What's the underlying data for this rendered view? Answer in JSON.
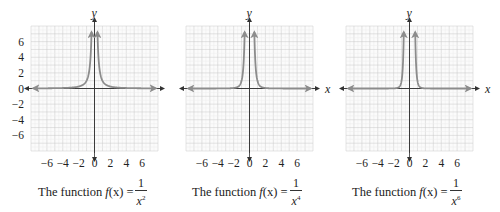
{
  "chart_data": [
    {
      "type": "line",
      "title": "The function f(x) = 1/x^2",
      "function": "1/x^2",
      "exponent": 2,
      "xlabel": "x",
      "ylabel": "y",
      "xlim": [
        -8,
        8
      ],
      "ylim": [
        -8,
        8
      ],
      "x_ticks": [
        "−6",
        "−4",
        "−2",
        "0",
        "2",
        "4",
        "6"
      ],
      "x_tick_values": [
        -6,
        -4,
        -2,
        0,
        2,
        4,
        6
      ],
      "y_ticks": [
        "6",
        "4",
        "2",
        "0",
        "−2",
        "−4",
        "−6"
      ],
      "y_tick_values": [
        6,
        4,
        2,
        0,
        -2,
        -4,
        -6
      ],
      "grid": true,
      "series": [
        {
          "name": "f(x) = 1/x^2 (x<0)",
          "x": [
            -8,
            -4,
            -2,
            -1,
            -0.5,
            -0.4
          ],
          "y": [
            0.016,
            0.0625,
            0.25,
            1,
            4,
            6.25
          ]
        },
        {
          "name": "f(x) = 1/x^2 (x>0)",
          "x": [
            0.4,
            0.5,
            1,
            2,
            4,
            8
          ],
          "y": [
            6.25,
            4,
            1,
            0.25,
            0.0625,
            0.016
          ]
        }
      ]
    },
    {
      "type": "line",
      "title": "The function f(x) = 1/x^4",
      "function": "1/x^4",
      "exponent": 4,
      "xlabel": "x",
      "ylabel": "y",
      "xlim": [
        -8,
        8
      ],
      "ylim": [
        -8,
        8
      ],
      "x_ticks": [
        "−6",
        "−4",
        "−2",
        "0",
        "2",
        "4",
        "6"
      ],
      "x_tick_values": [
        -6,
        -4,
        -2,
        0,
        2,
        4,
        6
      ],
      "y_ticks": [],
      "y_tick_values": [],
      "grid": true,
      "series": [
        {
          "name": "f(x) = 1/x^4 (x<0)",
          "x": [
            -8,
            -4,
            -2,
            -1,
            -0.7,
            -0.62
          ],
          "y": [
            0.0002,
            0.0039,
            0.0625,
            1,
            4.16,
            6.76
          ]
        },
        {
          "name": "f(x) = 1/x^4 (x>0)",
          "x": [
            0.62,
            0.7,
            1,
            2,
            4,
            8
          ],
          "y": [
            6.76,
            4.16,
            1,
            0.0625,
            0.0039,
            0.0002
          ]
        }
      ]
    },
    {
      "type": "line",
      "title": "The function f(x) = 1/x^6",
      "function": "1/x^6",
      "exponent": 6,
      "xlabel": "x",
      "ylabel": "y",
      "xlim": [
        -8,
        8
      ],
      "ylim": [
        -8,
        8
      ],
      "x_ticks": [
        "−6",
        "−4",
        "−2",
        "0",
        "2",
        "4",
        "6"
      ],
      "x_tick_values": [
        -6,
        -4,
        -2,
        0,
        2,
        4,
        6
      ],
      "y_ticks": [],
      "y_tick_values": [],
      "grid": true,
      "series": [
        {
          "name": "f(x) = 1/x^6 (x<0)",
          "x": [
            -8,
            -4,
            -2,
            -1,
            -0.8,
            -0.73
          ],
          "y": [
            3.8e-06,
            0.00024,
            0.0156,
            1,
            3.81,
            6.6
          ]
        },
        {
          "name": "f(x) = 1/x^6 (x>0)",
          "x": [
            0.73,
            0.8,
            1,
            2,
            4,
            8
          ],
          "y": [
            6.6,
            3.81,
            1,
            0.0156,
            0.00024,
            3.8e-06
          ]
        }
      ]
    }
  ],
  "panels": [
    {
      "caption_lead": "The function ",
      "f": "f",
      "paren_x": "(x)",
      "equals": " = ",
      "numerator": "1",
      "base": "x",
      "exponent": "2",
      "x_axis_label": "x",
      "y_axis_label": "y"
    },
    {
      "caption_lead": "The function ",
      "f": "f",
      "paren_x": "(x)",
      "equals": " = ",
      "numerator": "1",
      "base": "x",
      "exponent": "4",
      "x_axis_label": "x",
      "y_axis_label": "y"
    },
    {
      "caption_lead": "The function ",
      "f": "f",
      "paren_x": "(x)",
      "equals": " = ",
      "numerator": "1",
      "base": "x",
      "exponent": "6",
      "x_axis_label": "x",
      "y_axis_label": "y"
    }
  ],
  "colors": {
    "grid": "#dcdcdc",
    "grid_major": "#c8c8c8",
    "axis": "#333333",
    "curve": "#8c8c8c",
    "text": "#222222"
  }
}
